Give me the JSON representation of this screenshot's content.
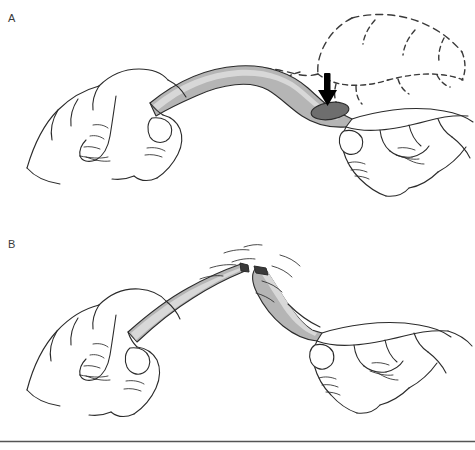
{
  "figure": {
    "width": 475,
    "height": 450,
    "background_color": "#ffffff",
    "line_color": "#2b2b2b",
    "divider_color": "#555555"
  },
  "panels": [
    {
      "id": "A",
      "label": "A",
      "caption_text": "",
      "description": "Both hands grasp a flexible tube and bend it into an arch; a solid black arrow points down at the kinked midpoint where the tube lumen shows as a dark ellipse. A dashed outline of the right hand shows its earlier position.",
      "elements": {
        "tube_fill": "#b5b5b5",
        "tube_highlight": "#d8d8d8",
        "tube_lumen_fill": "#6e6e6e",
        "arrow_color": "#000000",
        "ghost_hand_style": "dashed",
        "ghost_hand_color": "#3a3a3a"
      }
    },
    {
      "id": "B",
      "label": "B",
      "caption_text": "",
      "description": "The tube has separated into two segments; each hand holds one piece with the broken dark tips facing each other and short motion lines radiating away to show the snap.",
      "elements": {
        "tube_fill": "#b5b5b5",
        "tube_highlight": "#d8d8d8",
        "tube_tip_fill": "#3a3a3a",
        "motion_line_color": "#2b2b2b"
      }
    }
  ],
  "divider": {
    "name": "bottom-rule",
    "y": 441
  }
}
